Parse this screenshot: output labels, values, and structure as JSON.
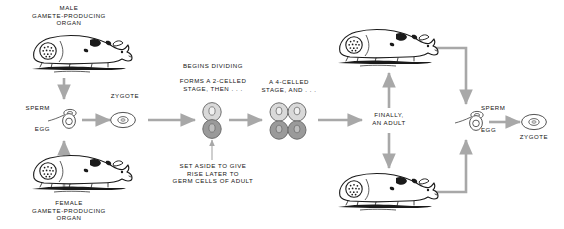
{
  "diagram": {
    "type": "biological-life-cycle-flow",
    "background_color": "#ffffff",
    "arrow_color": "#a8a8a8",
    "line_art_color": "#1a1a1a",
    "text_color": "#141414"
  },
  "labels": {
    "male_organ": "MALE\nGAMETE-PRODUCING\nORGAN",
    "female_organ": "FEMALE\nGAMETE-PRODUCING\nORGAN",
    "sperm_left": "SPERM",
    "egg_left": "EGG",
    "zygote_left": "ZYGOTE",
    "two_celled": "BEGINS DIVIDING\n\nFORMS A 2-CELLED\nSTAGE, THEN . . .",
    "two_celled_note": "SET ASIDE TO GIVE\nRISE LATER TO\nGERM CELLS OF ADULT",
    "four_celled": "A 4-CELLED\nSTAGE, AND . . .",
    "adult": "FINALLY,\nAN ADULT",
    "sperm_right": "SPERM",
    "egg_right": "EGG",
    "zygote_right": "ZYGOTE"
  },
  "stages": [
    {
      "id": "male-gonad",
      "label": "MALE GAMETE-PRODUCING ORGAN",
      "icon": "guinea-pig-with-gonad-icon"
    },
    {
      "id": "female-gonad",
      "label": "FEMALE GAMETE-PRODUCING ORGAN",
      "icon": "guinea-pig-with-gonad-icon"
    },
    {
      "id": "gametes-left",
      "label": "SPERM / EGG",
      "icon": "sperm-and-egg-icon"
    },
    {
      "id": "zygote-left",
      "label": "ZYGOTE",
      "icon": "zygote-cell-icon"
    },
    {
      "id": "two-cell",
      "label": "2-CELLED STAGE",
      "icon": "two-celled-embryo-icon",
      "cells": 2
    },
    {
      "id": "four-cell",
      "label": "4-CELLED STAGE",
      "icon": "four-celled-embryo-icon",
      "cells": 4
    },
    {
      "id": "adult",
      "label": "FINALLY, AN ADULT",
      "icon": "text-node"
    },
    {
      "id": "adult-male",
      "label": "ADULT MALE",
      "icon": "guinea-pig-with-gonad-icon"
    },
    {
      "id": "adult-female",
      "label": "ADULT FEMALE",
      "icon": "guinea-pig-with-gonad-icon"
    },
    {
      "id": "gametes-right",
      "label": "SPERM / EGG",
      "icon": "sperm-and-egg-icon"
    },
    {
      "id": "zygote-right",
      "label": "ZYGOTE",
      "icon": "zygote-cell-icon"
    }
  ],
  "cell_shading": {
    "somatic_cell_fill": "#d9d9d9",
    "germ_cell_fill": "#9a9a9a",
    "cell_outline": "#6e6e6e"
  }
}
